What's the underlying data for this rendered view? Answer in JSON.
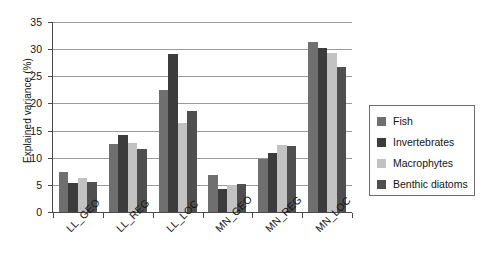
{
  "chart_data": {
    "type": "bar",
    "title": "",
    "subtitle": "",
    "xlabel": "",
    "ylabel": "Explained variance (%)",
    "ylim": [
      0,
      35
    ],
    "ytick_step": 5,
    "yticks": [
      "0",
      "5",
      "10",
      "15",
      "20",
      "25",
      "30",
      "35"
    ],
    "grid": true,
    "grid_axis": "y",
    "legend_position": "right",
    "categories": [
      "LL_GEO",
      "LL_REG",
      "LL_LOC",
      "MN_GEO",
      "MN_REG",
      "MN_LOC"
    ],
    "series": [
      {
        "name": "Fish",
        "color": "#6f6f6f",
        "values": [
          7.4,
          12.5,
          22.4,
          6.9,
          9.8,
          31.4
        ]
      },
      {
        "name": "Invertebrates",
        "color": "#3c3c3c",
        "values": [
          5.4,
          14.2,
          29.1,
          4.3,
          10.9,
          30.2
        ]
      },
      {
        "name": "Macrophytes",
        "color": "#c2c2c2",
        "values": [
          6.3,
          12.8,
          16.4,
          4.9,
          12.3,
          29.3
        ]
      },
      {
        "name": "Benthic diatoms",
        "color": "#4f4f4f",
        "values": [
          5.5,
          11.7,
          18.7,
          5.1,
          12.2,
          26.7
        ]
      }
    ]
  },
  "legend": {
    "entries": [
      {
        "label": "Fish",
        "color": "#6f6f6f"
      },
      {
        "label": "Invertebrates",
        "color": "#3c3c3c"
      },
      {
        "label": "Macrophytes",
        "color": "#c2c2c2"
      },
      {
        "label": "Benthic diatoms",
        "color": "#4f4f4f"
      }
    ]
  },
  "axes": {
    "y_title": "Explained variance (%)"
  }
}
